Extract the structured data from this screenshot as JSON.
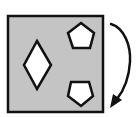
{
  "diagram": {
    "colors": {
      "background": "#ffffff",
      "panel_fill": "#c4c4c4",
      "stroke": "#111111",
      "shape_fill": "#ffffff"
    },
    "panel": {
      "x": 8,
      "y": 16,
      "width": 95,
      "height": 96
    },
    "shapes": [
      {
        "type": "diamond",
        "points": "37,41 51,65 37,89 24,65"
      },
      {
        "type": "pentagon",
        "orientation": "up",
        "points": "81,23 94,33 90,48 73,48 68,33"
      },
      {
        "type": "pentagon",
        "orientation": "down",
        "points": "71,82 89,82 93,96 81,106 68,96"
      }
    ],
    "arrow": {
      "direction": "clockwise",
      "path": "M 111 24 C 124 28, 131 45, 130 62 C 129 78, 124 90, 117 99",
      "head": "110,108 113,94 122,100"
    }
  }
}
